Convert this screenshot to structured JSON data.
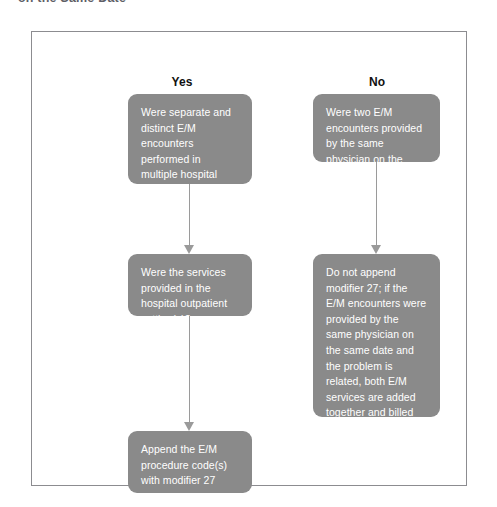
{
  "caption": {
    "text": "on the Same Date"
  },
  "figure": {
    "columns": [
      {
        "label": "Yes"
      },
      {
        "label": "No"
      }
    ],
    "boxes": {
      "yes_1": "Were separate and distinct E/M encounters performed in multiple hospital outpatient setting(s) on the same date?",
      "yes_2": "Were the services provided in the hospital outpatient setting(s)?",
      "yes_3": "Append the E/M procedure code(s) with modifier 27",
      "no_1": "Were two E/M encounters provided by the same physician on the same date?",
      "no_2": "Do not append modifier 27; if the E/M encounters were provided by the same physician on the same date and the problem is related, both E/M services are added together and billed with one E/M service code"
    },
    "colors": {
      "box_fill": "#8a8a8a",
      "box_text": "#ffffff",
      "frame_border": "#8c8c90",
      "arrow": "#9a9a9a",
      "heading_text": "#111111",
      "background": "#ffffff"
    }
  }
}
